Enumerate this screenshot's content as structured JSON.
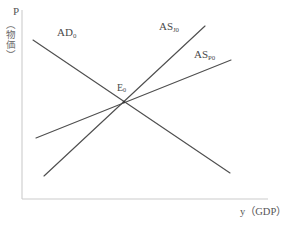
{
  "figure": {
    "title_fragment": "",
    "background_color": "#ffffff"
  },
  "axes": {
    "y_axis": {
      "symbol": "P",
      "description": "（物価）",
      "name": "price-level-axis",
      "color": "#c8c8c8"
    },
    "x_axis": {
      "label": "y（GDP）",
      "name": "real-gdp-axis",
      "color": "#c8c8c8"
    },
    "frame": {
      "origin_x": 22,
      "origin_y": 199,
      "right_x": 268,
      "top_y": 10
    }
  },
  "curves": [
    {
      "id": "ad0",
      "label": "AD",
      "subscript": "0",
      "role": "aggregate-demand",
      "slope": "downward",
      "color": "#4f4f4f",
      "x1": 33,
      "y1": 40,
      "x2": 230,
      "y2": 173
    },
    {
      "id": "as-j0",
      "label": "AS",
      "subscript": "J0",
      "role": "aggregate-supply-steep",
      "slope": "steep-upward",
      "color": "#4f4f4f",
      "x1": 44,
      "y1": 176,
      "x2": 205,
      "y2": 26
    },
    {
      "id": "as-p0",
      "label": "AS",
      "subscript": "P0",
      "role": "aggregate-supply-flat",
      "slope": "gentle-upward",
      "color": "#4f4f4f",
      "x1": 36,
      "y1": 138,
      "x2": 231,
      "y2": 60
    }
  ],
  "points": [
    {
      "id": "e0",
      "label": "E",
      "subscript": "0",
      "role": "equilibrium-point",
      "x": 124,
      "y": 102
    }
  ],
  "labels": {
    "y_symbol": "P",
    "y_description": "（物価）",
    "x_label": "y（GDP）",
    "ad0_base": "AD",
    "ad0_sub": "0",
    "as_j0_base": "AS",
    "as_j0_sub": "J0",
    "as_p0_base": "AS",
    "as_p0_sub": "P0",
    "e0_base": "E",
    "e0_sub": "0"
  }
}
